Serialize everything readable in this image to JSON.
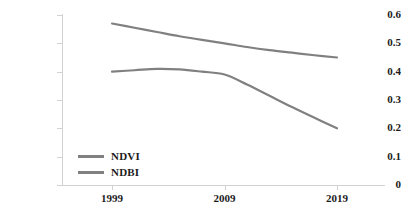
{
  "chart_data": {
    "type": "line",
    "title": "",
    "xlabel": "",
    "ylabel": "NDVI and NDBI value",
    "x": [
      1999,
      2009,
      2019
    ],
    "categories": [
      "1999",
      "2009",
      "2019"
    ],
    "xtick_labels": [
      "1999",
      "2009",
      "2019"
    ],
    "ytick_labels": [
      "0",
      "0.1",
      "0.2",
      "0.3",
      "0.4",
      "0.5",
      "0.6"
    ],
    "ytick_values": [
      0,
      0.1,
      0.2,
      0.3,
      0.4,
      0.5,
      0.6
    ],
    "ylim": [
      0,
      0.6
    ],
    "xlim": [
      1999,
      2019
    ],
    "grid": false,
    "legend_position": "lower-left-inside",
    "series": [
      {
        "name": "NDVI",
        "values": [
          0.57,
          0.5,
          0.45
        ],
        "color": "#808080",
        "dense_x": [
          1999,
          2001,
          2003,
          2005,
          2007,
          2009,
          2011,
          2013,
          2015,
          2017,
          2019
        ],
        "dense_values": [
          0.57,
          0.555,
          0.54,
          0.525,
          0.512,
          0.5,
          0.487,
          0.476,
          0.467,
          0.458,
          0.45
        ]
      },
      {
        "name": "NDBI",
        "values": [
          0.4,
          0.39,
          0.2
        ],
        "color": "#808080",
        "dense_x": [
          1999,
          2001,
          2003,
          2005,
          2007,
          2009,
          2011,
          2013,
          2015,
          2017,
          2019
        ],
        "dense_values": [
          0.4,
          0.405,
          0.41,
          0.408,
          0.4,
          0.39,
          0.355,
          0.315,
          0.275,
          0.237,
          0.2
        ]
      }
    ]
  },
  "axes": {
    "y_title": "NDVI and NDBI value"
  },
  "legend": {
    "items": [
      {
        "label": "NDVI"
      },
      {
        "label": "NDBI"
      }
    ]
  },
  "style": {
    "line_color": "#808080",
    "axis_color": "#d2d2d2",
    "text_color": "#1c1c1c",
    "background": "#ffffff"
  }
}
